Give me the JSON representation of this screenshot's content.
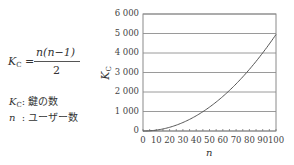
{
  "formula": {
    "lhs_symbol": "K",
    "lhs_subscript": "C",
    "equals": "=",
    "numerator": "n(n−1)",
    "denominator": "2"
  },
  "legend": [
    {
      "symbol": "K",
      "subscript": "C",
      "separator": ":",
      "description": "鍵の数"
    },
    {
      "symbol": "n",
      "subscript": "",
      "separator": ":",
      "description": "ユーザー数"
    }
  ],
  "chart_data": {
    "type": "line",
    "title": "",
    "xlabel": "n",
    "ylabel": "K_C",
    "xlim": [
      0,
      100
    ],
    "ylim": [
      0,
      6000
    ],
    "grid": "horizontal",
    "legend_position": "none",
    "x_ticks": [
      "0",
      "10",
      "20",
      "30",
      "40",
      "50",
      "60",
      "70",
      "80",
      "90",
      "100"
    ],
    "y_ticks": [
      "0",
      "1 000",
      "2 000",
      "3 000",
      "4 000",
      "5 000",
      "6 000"
    ],
    "x": [
      0,
      10,
      20,
      30,
      40,
      50,
      60,
      70,
      80,
      90,
      100
    ],
    "series": [
      {
        "name": "K_C = n(n-1)/2",
        "values": [
          0,
          45,
          190,
          435,
          780,
          1225,
          1770,
          2415,
          3160,
          4005,
          4950
        ]
      }
    ]
  },
  "axis": {
    "xlabel": "n",
    "ylabel_symbol": "K",
    "ylabel_subscript": "C"
  }
}
